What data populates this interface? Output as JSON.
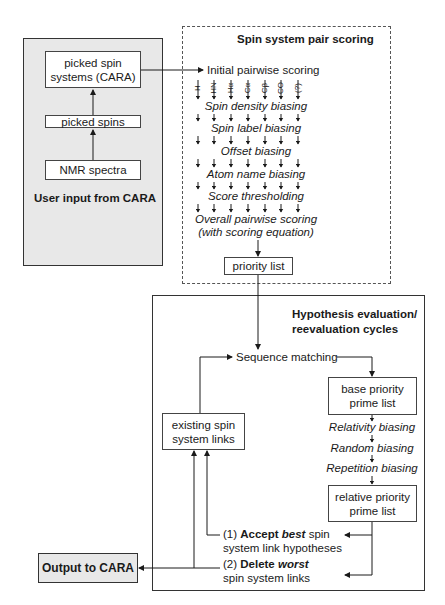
{
  "user_input_panel": {
    "title": "User input from CARA",
    "boxes": [
      "picked spin\nsystems (CARA)",
      "picked spins",
      "NMR spectra"
    ]
  },
  "pair_scoring_panel": {
    "title": "Spin system pair scoring",
    "initial_step": "Initial pairwise scoring",
    "column_labels": [
      "H",
      "HN",
      "Hα",
      "Cα",
      "Cβ",
      "CO",
      "(?)"
    ],
    "steps": [
      "Spin density biasing",
      "Spin label biasing",
      "Offset biasing",
      "Atom name biasing",
      "Score thresholding"
    ],
    "final_step_line1": "Overall pairwise scoring",
    "final_step_line2": "(with scoring equation)",
    "output_box": "priority list"
  },
  "hypothesis_panel": {
    "title_line1": "Hypothesis evaluation/",
    "title_line2": "reevaluation cycles",
    "sequence_matching": "Sequence matching",
    "base_box_line1": "base priority",
    "base_box_line2": "prime list",
    "biasing_steps": [
      "Relativity biasing",
      "Random biasing",
      "Repetition biasing"
    ],
    "relative_box_line1": "relative priority",
    "relative_box_line2": "prime list",
    "existing_box_line1": "existing spin",
    "existing_box_line2": "system links",
    "accept": {
      "prefix": "(1) ",
      "bold": "Accept ",
      "bold_italic": "best",
      "rest_line1": " spin",
      "line2": "system link hypotheses"
    },
    "delete": {
      "prefix": "(2) ",
      "bold": "Delete ",
      "bold_italic": "worst",
      "line2": "spin system links"
    }
  },
  "output_box": {
    "label": "Output to CARA"
  },
  "colors": {
    "panel_gray": "#e8e8e8",
    "line": "#1a1a1a",
    "border": "#444444"
  }
}
